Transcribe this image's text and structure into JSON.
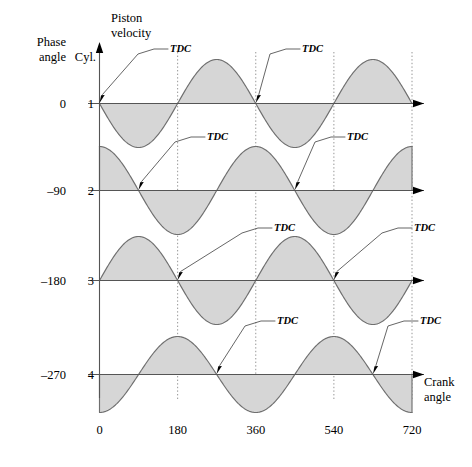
{
  "labels": {
    "y_axis_title_line1": "Piston",
    "y_axis_title_line2": "velocity",
    "x_axis_title_line1": "Crank",
    "x_axis_title_line2": "angle",
    "phase_header_line1": "Phase",
    "phase_header_line2": "angle",
    "cyl_header": "Cyl.",
    "tdc": "TDC"
  },
  "rows": [
    {
      "cylinder": "1",
      "phase_angle": "0"
    },
    {
      "cylinder": "2",
      "phase_angle": "–90"
    },
    {
      "cylinder": "3",
      "phase_angle": "–180"
    },
    {
      "cylinder": "4",
      "phase_angle": "–270"
    }
  ],
  "colors": {
    "wave_fill": "#d6d6d6",
    "wave_stroke": "#6f6f6f",
    "axis": "#555555",
    "gridline": "#8a8a8a",
    "text": "#000000"
  },
  "chart_data": {
    "type": "line",
    "title": "",
    "xlabel": "Crank angle",
    "ylabel": "Piston velocity",
    "x": [
      0,
      180,
      360,
      540,
      720
    ],
    "xlim": [
      0,
      720
    ],
    "ylim": [
      -1,
      1
    ],
    "tick_labels": [
      "0",
      "180",
      "360",
      "540",
      "720"
    ],
    "grid": "vertical dotted at every x tick",
    "legend": "none",
    "period_degrees": 360,
    "amplitude": 1,
    "series": [
      {
        "name": "Cyl. 1",
        "phase_angle": 0,
        "formula": "-sin(theta)",
        "tdc_degrees": [
          0,
          360
        ],
        "values_at_x": [
          0,
          0,
          0,
          0,
          0
        ],
        "sampled_degrees": [
          0,
          45,
          90,
          135,
          180,
          225,
          270,
          315,
          360,
          405,
          450,
          495,
          540,
          585,
          630,
          675,
          720
        ],
        "sampled_values": [
          0,
          -0.707,
          -1,
          -0.707,
          0,
          0.707,
          1,
          0.707,
          0,
          -0.707,
          -1,
          -0.707,
          0,
          0.707,
          1,
          0.707,
          0
        ]
      },
      {
        "name": "Cyl. 2",
        "phase_angle": -90,
        "formula": "cos(theta)",
        "tdc_degrees": [
          90,
          450
        ],
        "values_at_x": [
          1,
          -1,
          1,
          -1,
          1
        ],
        "sampled_degrees": [
          0,
          45,
          90,
          135,
          180,
          225,
          270,
          315,
          360,
          405,
          450,
          495,
          540,
          585,
          630,
          675,
          720
        ],
        "sampled_values": [
          1,
          0.707,
          0,
          -0.707,
          -1,
          -0.707,
          0,
          0.707,
          1,
          0.707,
          0,
          -0.707,
          -1,
          -0.707,
          0,
          0.707,
          1
        ]
      },
      {
        "name": "Cyl. 3",
        "phase_angle": -180,
        "formula": "sin(theta)",
        "tdc_degrees": [
          180,
          540
        ],
        "values_at_x": [
          0,
          0,
          0,
          0,
          0
        ],
        "sampled_degrees": [
          0,
          45,
          90,
          135,
          180,
          225,
          270,
          315,
          360,
          405,
          450,
          495,
          540,
          585,
          630,
          675,
          720
        ],
        "sampled_values": [
          0,
          0.707,
          1,
          0.707,
          0,
          -0.707,
          -1,
          -0.707,
          0,
          0.707,
          1,
          0.707,
          0,
          -0.707,
          -1,
          -0.707,
          0
        ]
      },
      {
        "name": "Cyl. 4",
        "phase_angle": -270,
        "formula": "-cos(theta)",
        "tdc_degrees": [
          270,
          630
        ],
        "values_at_x": [
          -1,
          1,
          -1,
          1,
          -1
        ],
        "sampled_degrees": [
          0,
          45,
          90,
          135,
          180,
          225,
          270,
          315,
          360,
          405,
          450,
          495,
          540,
          585,
          630,
          675,
          720
        ],
        "sampled_values": [
          -1,
          -0.707,
          0,
          0.707,
          1,
          0.707,
          0,
          -0.707,
          -1,
          -0.707,
          0,
          0.707,
          1,
          0.707,
          0,
          -0.707,
          -1
        ]
      }
    ]
  },
  "annotations": [
    {
      "row": 1,
      "label": "TDC",
      "at_degrees": 0,
      "text_x": 168,
      "text_y": 52
    },
    {
      "row": 1,
      "label": "TDC",
      "at_degrees": 360,
      "text_x": 300,
      "text_y": 52
    },
    {
      "row": 2,
      "label": "TDC",
      "at_degrees": 90,
      "text_x": 205,
      "text_y": 140
    },
    {
      "row": 2,
      "label": "TDC",
      "at_degrees": 450,
      "text_x": 345,
      "text_y": 140
    },
    {
      "row": 3,
      "label": "TDC",
      "at_degrees": 180,
      "text_x": 272,
      "text_y": 231
    },
    {
      "row": 3,
      "label": "TDC",
      "at_degrees": 540,
      "text_x": 412,
      "text_y": 231
    },
    {
      "row": 4,
      "label": "TDC",
      "at_degrees": 270,
      "text_x": 275,
      "text_y": 324
    },
    {
      "row": 4,
      "label": "TDC",
      "at_degrees": 630,
      "text_x": 418,
      "text_y": 324
    }
  ]
}
